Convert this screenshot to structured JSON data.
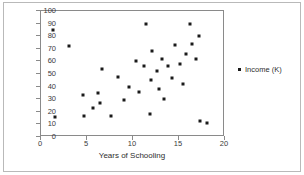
{
  "chart_data": {
    "type": "scatter",
    "title": "",
    "xlabel": "Years of Schooling",
    "ylabel": "",
    "xlim": [
      0,
      20
    ],
    "ylim": [
      0,
      100
    ],
    "xticks": [
      0,
      5,
      10,
      15,
      20
    ],
    "yticks": [
      0,
      10,
      20,
      30,
      40,
      50,
      60,
      70,
      80,
      90,
      100
    ],
    "grid": false,
    "legend_position": "right",
    "marker": "square",
    "marker_color": "#1a1a1a",
    "series": [
      {
        "name": "Income (K)",
        "points": [
          [
            1.3,
            85
          ],
          [
            1.5,
            16
          ],
          [
            3.0,
            72
          ],
          [
            4.6,
            33
          ],
          [
            4.7,
            17
          ],
          [
            5.6,
            23
          ],
          [
            6.2,
            35
          ],
          [
            6.4,
            27
          ],
          [
            6.6,
            54
          ],
          [
            7.6,
            17
          ],
          [
            8.4,
            48
          ],
          [
            9.0,
            29
          ],
          [
            9.6,
            40
          ],
          [
            10.3,
            60
          ],
          [
            10.6,
            36
          ],
          [
            11.2,
            56
          ],
          [
            11.4,
            90
          ],
          [
            11.8,
            18
          ],
          [
            12.0,
            45
          ],
          [
            12.1,
            68
          ],
          [
            12.6,
            52
          ],
          [
            12.8,
            38
          ],
          [
            13.2,
            62
          ],
          [
            13.4,
            30
          ],
          [
            13.8,
            56
          ],
          [
            14.2,
            47
          ],
          [
            14.6,
            73
          ],
          [
            15.1,
            58
          ],
          [
            15.4,
            42
          ],
          [
            15.8,
            66
          ],
          [
            16.2,
            90
          ],
          [
            16.4,
            74
          ],
          [
            16.8,
            62
          ],
          [
            17.2,
            80
          ],
          [
            17.3,
            13
          ],
          [
            18.0,
            11
          ]
        ]
      }
    ]
  },
  "legend": {
    "entries": [
      {
        "label": "Income (K)",
        "marker": "square-marker",
        "color": "#1a1a1a"
      }
    ]
  },
  "axes": {
    "x": {
      "title": "Years of Schooling",
      "tick_labels": [
        "0",
        "5",
        "10",
        "15",
        "20"
      ]
    },
    "y": {
      "title": "",
      "tick_labels": [
        "0",
        "10",
        "20",
        "30",
        "40",
        "50",
        "60",
        "70",
        "80",
        "90",
        "100"
      ]
    }
  }
}
